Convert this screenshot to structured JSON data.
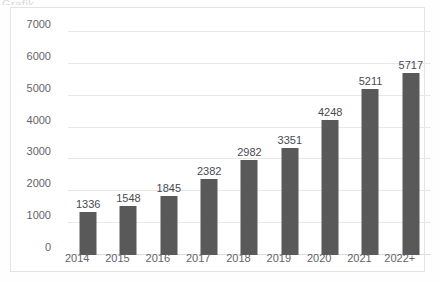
{
  "title_remnant": "Grafik",
  "colors": {
    "bar": "#595959",
    "gridline": "#e8e8ea",
    "baseline": "#dcdcdf",
    "frame_border": "#e3e3e6",
    "tick_text": "#63636a",
    "label_text": "#4a4a50",
    "background": "#ffffff"
  },
  "chart_data": {
    "type": "bar",
    "title": "",
    "xlabel": "",
    "ylabel": "",
    "categories": [
      "2014",
      "2015",
      "2016",
      "2017",
      "2018",
      "2019",
      "2020",
      "2021",
      "2022+"
    ],
    "values": [
      1336,
      1548,
      1845,
      2382,
      2982,
      3351,
      4248,
      5211,
      5717
    ],
    "data_labels": [
      "1336",
      "1548",
      "1845",
      "2382",
      "2982",
      "3351",
      "4248",
      "5211",
      "5717"
    ],
    "ylim": [
      0,
      7000
    ],
    "ytick_step": 1000,
    "ytick_labels": [
      "7000",
      "6000",
      "5000",
      "4000",
      "3000",
      "2000",
      "1000",
      "0"
    ],
    "ytick_values": [
      7000,
      6000,
      5000,
      4000,
      3000,
      2000,
      1000,
      0
    ],
    "grid": "horizontal",
    "legend": "none",
    "series": [
      {
        "name": "",
        "values": [
          1336,
          1548,
          1845,
          2382,
          2982,
          3351,
          4248,
          5211,
          5717
        ]
      }
    ]
  }
}
